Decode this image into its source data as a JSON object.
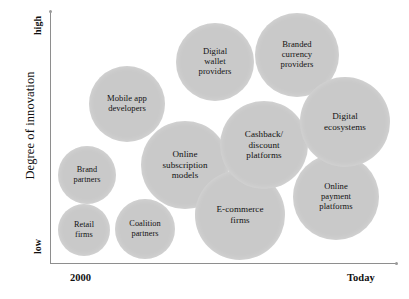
{
  "chart_data": {
    "type": "scatter",
    "title": "",
    "xlabel": "",
    "ylabel": "Degree of innovation",
    "x_tick_labels": [
      "2000",
      "Today"
    ],
    "y_tick_labels": [
      "low",
      "high"
    ],
    "xlim": [
      "2000",
      "Today"
    ],
    "ylim": [
      "low",
      "high"
    ],
    "grid": false,
    "legend": "none",
    "bubble_color": "#c9c9c9",
    "axis_color": "#8e8e8e",
    "note": "Bubble positions encode time (x) and degree of innovation (y); bubble radius encodes relative size.",
    "points": [
      {
        "label": "Retail\nfirms",
        "label_flat": "Retail firms",
        "x": 0.04,
        "y": 0.08,
        "r": 26,
        "cx": 84,
        "cy": 230
      },
      {
        "label": "Brand\npartners",
        "label_flat": "Brand partners",
        "x": 0.06,
        "y": 0.35,
        "r": 29,
        "cx": 87,
        "cy": 175
      },
      {
        "label": "Coalition\npartners",
        "label_flat": "Coalition partners",
        "x": 0.21,
        "y": 0.09,
        "r": 30,
        "cx": 145,
        "cy": 229
      },
      {
        "label": "Mobile app\ndevelopers",
        "label_flat": "Mobile app developers",
        "x": 0.22,
        "y": 0.72,
        "r": 38,
        "cx": 127,
        "cy": 104
      },
      {
        "label": "Online\nsubscription\nmodels",
        "label_flat": "Online subscription models",
        "x": 0.34,
        "y": 0.42,
        "r": 44,
        "cx": 185,
        "cy": 165
      },
      {
        "label": "Digital\nwallet\nproviders",
        "label_flat": "Digital wallet providers",
        "x": 0.42,
        "y": 0.87,
        "r": 39,
        "cx": 215,
        "cy": 62
      },
      {
        "label": "E-commerce\nfirms",
        "label_flat": "E-commerce firms",
        "x": 0.52,
        "y": 0.15,
        "r": 45,
        "cx": 240,
        "cy": 215
      },
      {
        "label": "Cashback/\ndiscount\nplatforms",
        "label_flat": "Cashback/discount platforms",
        "x": 0.57,
        "y": 0.52,
        "r": 44,
        "cx": 264,
        "cy": 145
      },
      {
        "label": "Branded\ncurrency\nproviders",
        "label_flat": "Branded currency providers",
        "x": 0.68,
        "y": 0.9,
        "r": 42,
        "cx": 297,
        "cy": 55
      },
      {
        "label": "Online\npayment\nplatforms",
        "label_flat": "Online payment platforms",
        "x": 0.84,
        "y": 0.3,
        "r": 43,
        "cx": 336,
        "cy": 197
      },
      {
        "label": "Digital\necosystems",
        "label_flat": "Digital ecosystems",
        "x": 0.86,
        "y": 0.63,
        "r": 45,
        "cx": 345,
        "cy": 122
      }
    ]
  },
  "axes": {
    "y_title": "Degree of innovation",
    "y_high": "high",
    "y_low": "low",
    "x_start": "2000",
    "x_end": "Today"
  }
}
